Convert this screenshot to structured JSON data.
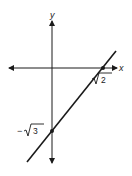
{
  "figure": {
    "type": "graph-of-line",
    "axes": {
      "x_label": "x",
      "y_label": "y"
    },
    "points": [
      {
        "name": "x-intercept",
        "label_radical": "2",
        "label_sign": "",
        "label": "√2"
      },
      {
        "name": "y-intercept",
        "label_radical": "3",
        "label_sign": "−",
        "label": "−√3"
      }
    ],
    "colors": {
      "ink": "#1a1a1a",
      "background": "#ffffff"
    }
  }
}
